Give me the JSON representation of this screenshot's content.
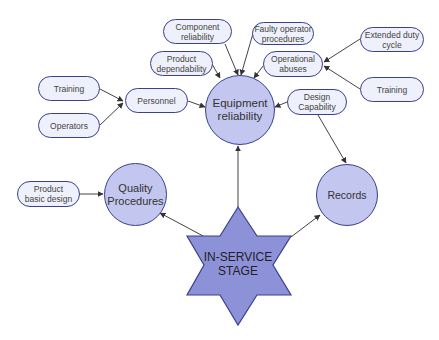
{
  "diagram": {
    "center": {
      "label_line1": "IN-SERVICE",
      "label_line2": "STAGE"
    },
    "hubs": {
      "equipment": {
        "line1": "Equipment",
        "line2": "reliability"
      },
      "quality": {
        "line1": "Quality",
        "line2": "Procedures"
      },
      "records": {
        "line1": "Records"
      }
    },
    "factors": {
      "component": {
        "line1": "Component",
        "line2": "reliability"
      },
      "faulty": {
        "line1": "Faulty operator",
        "line2": "procedures"
      },
      "product_dep": {
        "line1": "Product",
        "line2": "dependability"
      },
      "operational": {
        "line1": "Operational",
        "line2": "abuses"
      },
      "extended": {
        "line1": "Extended duty",
        "line2": "cycle"
      },
      "training_right": {
        "line1": "Training"
      },
      "training_left": {
        "line1": "Training"
      },
      "operators": {
        "line1": "Operators"
      },
      "personnel": {
        "line1": "Personnel"
      },
      "design_cap": {
        "line1": "Design",
        "line2": "Capability"
      },
      "product_basic": {
        "line1": "Product",
        "line2": "basic design"
      }
    },
    "colors": {
      "pill_fill": "#eef0fb",
      "circle_fill": "#c3c6ee",
      "star_fill": "#8c91d8",
      "stroke": "#3a3f8f",
      "arrow": "#333333"
    }
  }
}
